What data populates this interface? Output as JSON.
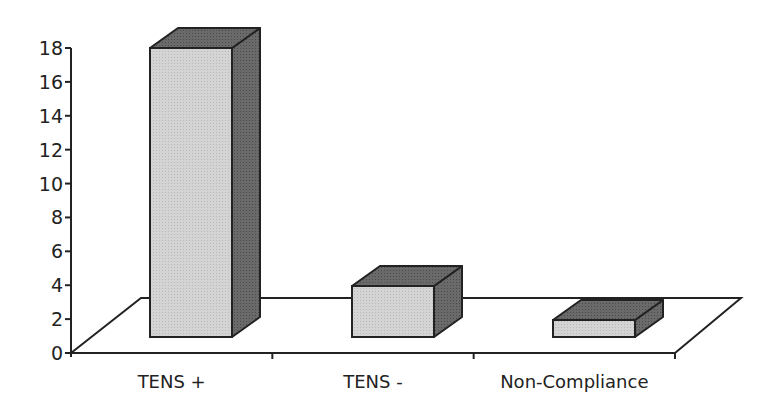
{
  "chart_data": {
    "type": "bar",
    "style": "3d-column",
    "title": "",
    "xlabel": "",
    "ylabel": "",
    "categories": [
      "TENS +",
      "TENS -",
      "Non-Compliance"
    ],
    "values": [
      17,
      3,
      1
    ],
    "ylim": [
      0,
      18
    ],
    "yticks": [
      0,
      2,
      4,
      6,
      8,
      10,
      12,
      14,
      16,
      18
    ],
    "grid": false,
    "legend": null,
    "colors": {
      "front": "#d0d0d0",
      "top": "#6e6e6e",
      "side": "#5a5a5a",
      "outline": "#222222"
    }
  }
}
